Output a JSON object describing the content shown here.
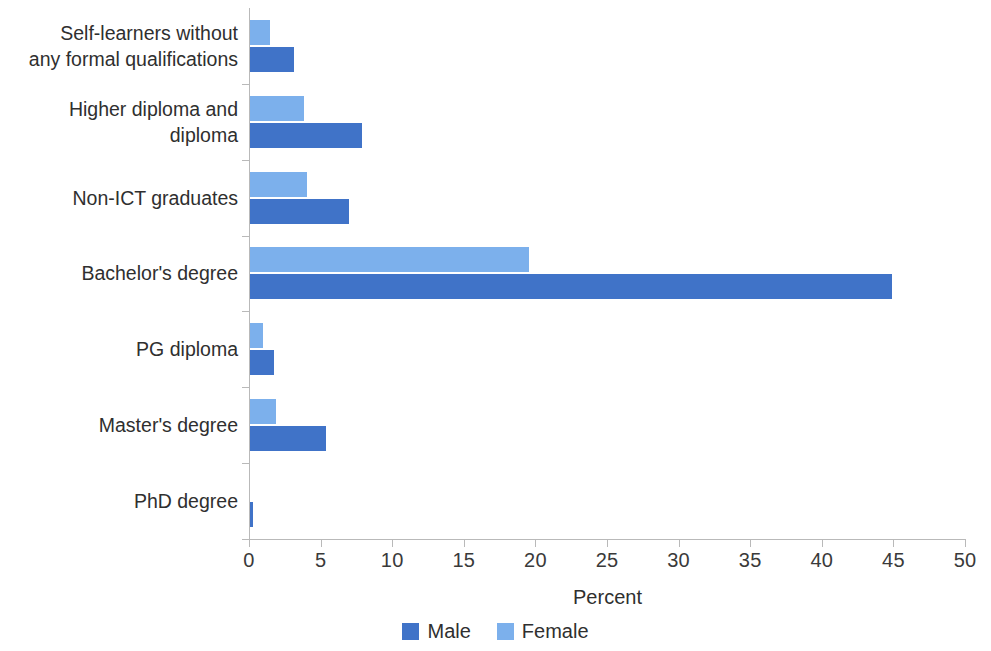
{
  "chart_data": {
    "type": "bar",
    "orientation": "horizontal",
    "title": "",
    "xlabel": "Percent",
    "ylabel": "",
    "xlim": [
      0,
      50
    ],
    "xticks": [
      0,
      5,
      10,
      15,
      20,
      25,
      30,
      35,
      40,
      45,
      50
    ],
    "xtick_labels": [
      "0",
      "5",
      "10",
      "15",
      "20",
      "25",
      "30",
      "35",
      "40",
      "45",
      "50"
    ],
    "grid": false,
    "legend_position": "bottom",
    "categories": [
      "Self-learners without\nany formal qualifications",
      "Higher diploma and\ndiploma",
      "Non-ICT graduates",
      "Bachelor's degree",
      "PG diploma",
      "Master's degree",
      "PhD degree"
    ],
    "series": [
      {
        "name": "Male",
        "color": "#4073c8",
        "values": [
          3.1,
          7.8,
          6.9,
          44.8,
          1.7,
          5.3,
          0.2
        ]
      },
      {
        "name": "Female",
        "color": "#7cb0ec",
        "values": [
          1.4,
          3.8,
          4.0,
          19.5,
          0.9,
          1.8,
          0.0
        ]
      }
    ]
  },
  "legend": {
    "items": [
      {
        "label": "Male",
        "color": "#4073c8"
      },
      {
        "label": "Female",
        "color": "#7cb0ec"
      }
    ]
  },
  "axis": {
    "x_title": "Percent"
  }
}
